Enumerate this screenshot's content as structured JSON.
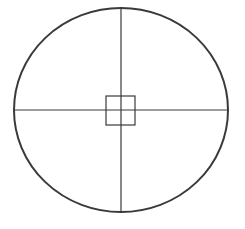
{
  "diagram": {
    "canvas": {
      "width": 245,
      "height": 229,
      "background": "#ffffff"
    },
    "stroke_color": "#3a3a3a",
    "circle": {
      "cx": 121,
      "cy": 110,
      "rx": 107,
      "ry": 102,
      "stroke_width": 2
    },
    "vertical_line": {
      "x1": 121,
      "y1": 8,
      "x2": 121,
      "y2": 212,
      "stroke_width": 1.2
    },
    "horizontal_line": {
      "x1": 14,
      "y1": 110,
      "x2": 228,
      "y2": 110,
      "stroke_width": 1.2
    },
    "center_square": {
      "x": 106,
      "y": 96,
      "width": 29,
      "height": 29,
      "stroke_width": 1.2
    }
  }
}
